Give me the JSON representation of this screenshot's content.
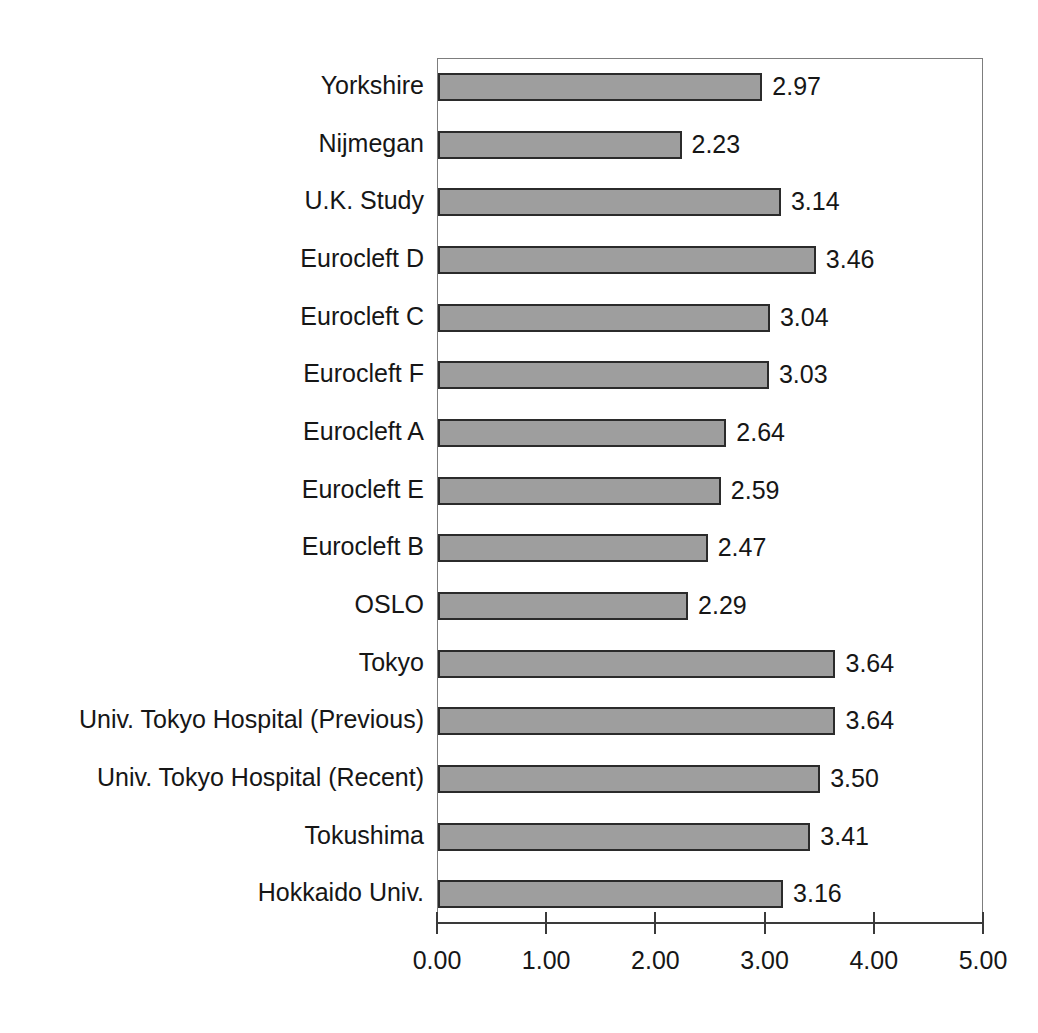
{
  "chart_data": {
    "type": "bar",
    "orientation": "horizontal",
    "title": "",
    "xlabel": "",
    "ylabel": "",
    "xlim": [
      0,
      5
    ],
    "xticks": [
      "0.00",
      "1.00",
      "2.00",
      "3.00",
      "4.00",
      "5.00"
    ],
    "xtick_values": [
      0,
      1,
      2,
      3,
      4,
      5
    ],
    "grid": false,
    "legend": false,
    "bar_color": "#9e9e9e",
    "bar_border_color": "#2b2b2b",
    "axis_color": "#3a3a3a",
    "categories": [
      "Yorkshire",
      "Nijmegan",
      "U.K. Study",
      "Eurocleft D",
      "Eurocleft C",
      "Eurocleft F",
      "Eurocleft A",
      "Eurocleft E",
      "Eurocleft B",
      "OSLO",
      "Tokyo",
      "Univ. Tokyo Hospital (Previous)",
      "Univ. Tokyo Hospital (Recent)",
      "Tokushima",
      "Hokkaido Univ."
    ],
    "values": [
      2.97,
      2.23,
      3.14,
      3.46,
      3.04,
      3.03,
      2.64,
      2.59,
      2.47,
      2.29,
      3.64,
      3.64,
      3.5,
      3.41,
      3.16
    ],
    "value_labels": [
      "2.97",
      "2.23",
      "3.14",
      "3.46",
      "3.04",
      "3.03",
      "2.64",
      "2.59",
      "2.47",
      "2.29",
      "3.64",
      "3.64",
      "3.50",
      "3.41",
      "3.16"
    ]
  },
  "title_remnant": ""
}
